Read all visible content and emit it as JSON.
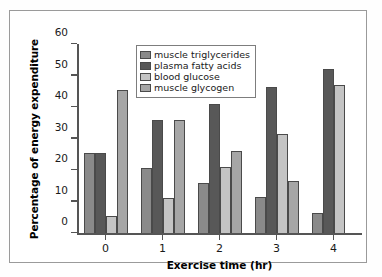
{
  "chart_data": {
    "type": "bar",
    "title": "",
    "xlabel": "Exercise time (hr)",
    "ylabel": "Percentage of energy expenditure",
    "categories": [
      "0",
      "1",
      "2",
      "3",
      "4"
    ],
    "ylim": [
      0,
      60
    ],
    "yticks": [
      0,
      10,
      20,
      30,
      40,
      50,
      60
    ],
    "ytick_labels": [
      "0",
      "10",
      "20",
      "30",
      "40",
      "50",
      "60"
    ],
    "xtick_labels": [
      "0",
      "1",
      "2",
      "3",
      "4"
    ],
    "grid": false,
    "legend_position": "upper-center-left",
    "series": [
      {
        "name": "muscle triglycerides",
        "color": "#8a8a8a",
        "values": [
          25.5,
          20.5,
          16.0,
          11.5,
          6.5
        ]
      },
      {
        "name": "plasma fatty acids",
        "color": "#585858",
        "values": [
          25.5,
          36.0,
          41.0,
          46.5,
          52.0
        ]
      },
      {
        "name": "blood glucose",
        "color": "#c4c4c4",
        "values": [
          5.5,
          11.0,
          21.0,
          31.5,
          47.0
        ]
      },
      {
        "name": "muscle glycogen",
        "color": "#a6a6a6",
        "values": [
          45.5,
          36.0,
          26.0,
          16.5,
          0
        ]
      }
    ]
  },
  "figure": {
    "border_color": "#9a9a9a",
    "background": "#ffffff",
    "axis_color": "#555555"
  }
}
